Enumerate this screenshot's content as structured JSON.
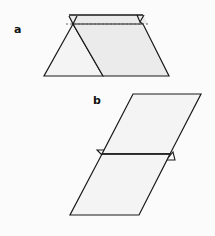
{
  "figure": {
    "panels": [
      {
        "label": "a",
        "description": "Triangle and parallelogram sharing a slanted edge, with a dashed fold line near the top and a small triangular flap at the top right"
      },
      {
        "label": "b",
        "description": "Tall parallelogram divided by a horizontal line with small triangular tabs at both ends of the dividing line"
      }
    ],
    "colors": {
      "stroke": "#1a1a1a",
      "fill_light": "#f4f4f4",
      "fill_shaded": "#ebebeb",
      "background": "#fbfbfb"
    }
  }
}
